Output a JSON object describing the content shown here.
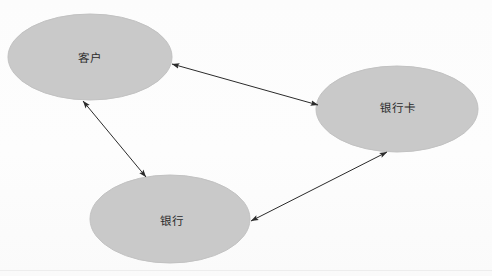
{
  "diagram": {
    "type": "entity-relationship-diagram",
    "background_color": "#fefefe",
    "node_fill_color": "#c9c9c9",
    "node_stroke_color": "#c2c2c2",
    "edge_color": "#2b2b2b",
    "text_color": "#2b2b2b",
    "nodes": [
      {
        "id": "customer",
        "label": "客户",
        "shape": "ellipse",
        "cx": 90,
        "cy": 57,
        "rx": 82,
        "ry": 43,
        "label_x": 90,
        "label_y": 58
      },
      {
        "id": "bank-card",
        "label": "银行卡",
        "shape": "ellipse",
        "cx": 397,
        "cy": 109,
        "rx": 81,
        "ry": 43,
        "label_x": 398,
        "label_y": 108
      },
      {
        "id": "bank",
        "label": "银行",
        "shape": "ellipse",
        "cx": 170,
        "cy": 219,
        "rx": 80,
        "ry": 44,
        "label_x": 172,
        "label_y": 221
      }
    ],
    "edges": [
      {
        "id": "customer-bank-card",
        "from": "customer",
        "to": "bank-card",
        "arrow": "double",
        "x1": 172,
        "y1": 64,
        "x2": 318,
        "y2": 105
      },
      {
        "id": "customer-bank",
        "from": "customer",
        "to": "bank",
        "arrow": "double",
        "x1": 83,
        "y1": 101,
        "x2": 146,
        "y2": 177
      },
      {
        "id": "bank-bank-card",
        "from": "bank",
        "to": "bank-card",
        "arrow": "double",
        "x1": 251,
        "y1": 221,
        "x2": 387,
        "y2": 152
      }
    ],
    "rules": [
      {
        "id": "bottom-rule",
        "y": 270
      }
    ]
  }
}
